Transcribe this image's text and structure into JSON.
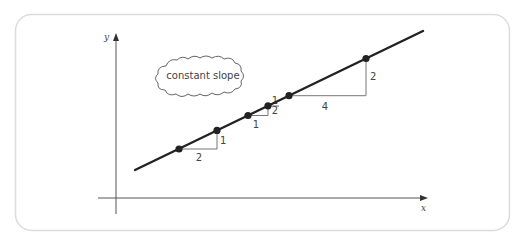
{
  "callout": {
    "text": "constant slope"
  },
  "axes": {
    "x_label": "x",
    "y_label": "y"
  },
  "colors": {
    "line": "#222222",
    "triangle": "#777777",
    "axis": "#555555",
    "card_border": "#dcdcdc"
  },
  "line": {
    "from": [
      135,
      170
    ],
    "to": [
      423,
      31
    ]
  },
  "points": [
    [
      179,
      149
    ],
    [
      217,
      130.4
    ],
    [
      248,
      115.5
    ],
    [
      268,
      105.8
    ],
    [
      289,
      95.7
    ],
    [
      366,
      58.5
    ]
  ],
  "triangles": [
    {
      "run_label": "2",
      "rise_label": "1",
      "x1": 179,
      "x2": 217,
      "y1": 149,
      "y2": 130.4,
      "run_pos": [
        199,
        161
      ],
      "rise_pos": [
        220,
        144
      ]
    },
    {
      "run_label": "1",
      "rise_num": "1",
      "rise_den": "2",
      "x1": 248,
      "x2": 268,
      "y1": 115.5,
      "y2": 105.8,
      "run_pos": [
        256,
        128
      ],
      "rise_pos": [
        272,
        104
      ]
    },
    {
      "run_label": "4",
      "rise_label": "2",
      "x1": 289,
      "x2": 366,
      "y1": 95.7,
      "y2": 58.5,
      "run_pos": [
        325,
        110
      ],
      "rise_pos": [
        370,
        80
      ]
    }
  ],
  "chart_data": {
    "type": "line",
    "title": "",
    "annotations": [
      "constant slope"
    ],
    "xlabel": "x",
    "ylabel": "y",
    "slope": 0.5,
    "slope_triangles": [
      {
        "run": 2,
        "rise": 1
      },
      {
        "run": 1,
        "rise": "1/2"
      },
      {
        "run": 4,
        "rise": 2
      }
    ],
    "grid": false
  }
}
